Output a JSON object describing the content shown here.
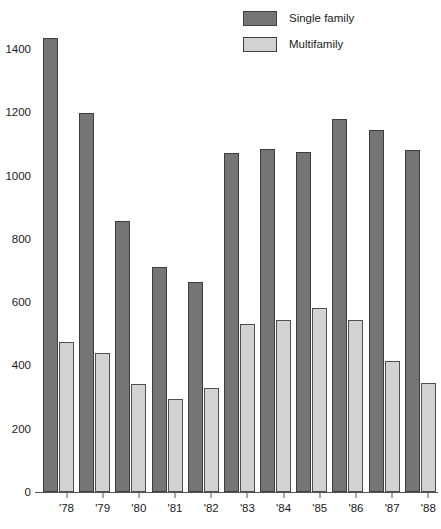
{
  "legend": {
    "position": "top-right",
    "entries": [
      {
        "label": "Single family",
        "color": "#757575",
        "key": "single_family"
      },
      {
        "label": "Multifamily",
        "color": "#d2d2d2",
        "key": "multifamily"
      }
    ]
  },
  "axes": {
    "y_ticks": [
      0,
      200,
      400,
      600,
      800,
      1000,
      1200,
      1400
    ],
    "x_ticks": [
      "'78",
      "'79",
      "'80",
      "'81",
      "'82",
      "'83",
      "'84",
      "'85",
      "'86",
      "'87",
      "'88"
    ]
  },
  "chart_data": {
    "type": "bar",
    "title": "",
    "subtitle": "",
    "xlabel": "",
    "ylabel": "",
    "ylim": [
      0,
      1460
    ],
    "grid": false,
    "legend_position": "top-right",
    "categories": [
      "'78",
      "'79",
      "'80",
      "'81",
      "'82",
      "'83",
      "'84",
      "'85",
      "'86",
      "'87",
      "'88"
    ],
    "series": [
      {
        "name": "Single family",
        "color": "#757575",
        "values": [
          1435,
          1197,
          858,
          710,
          665,
          1070,
          1085,
          1075,
          1180,
          1145,
          1080
        ]
      },
      {
        "name": "Multifamily",
        "color": "#d2d2d2",
        "values": [
          475,
          440,
          340,
          295,
          330,
          530,
          545,
          580,
          545,
          415,
          345
        ]
      }
    ],
    "y_tick_labels": [
      "0",
      "200",
      "400",
      "600",
      "800",
      "1000",
      "1200",
      "1400"
    ],
    "x_tick_labels": [
      "'78",
      "'79",
      "'80",
      "'81",
      "'82",
      "'83",
      "'84",
      "'85",
      "'86",
      "'87",
      "'88"
    ]
  }
}
